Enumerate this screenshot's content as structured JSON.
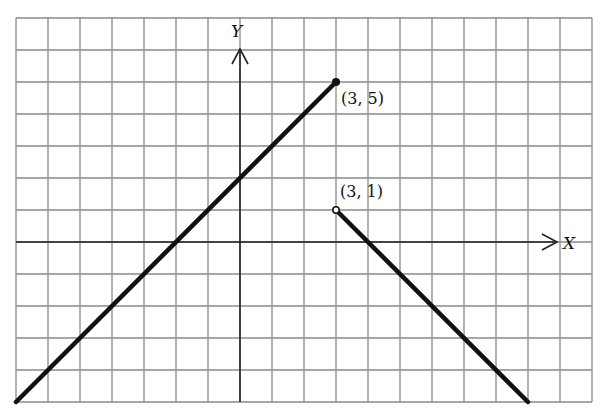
{
  "chart_data": {
    "type": "line",
    "title": "",
    "xlabel": "X",
    "ylabel": "Y",
    "xlim": [
      -7,
      11
    ],
    "ylim": [
      -5,
      7
    ],
    "grid": true,
    "grid_step": 1,
    "series": [
      {
        "name": "left-piece",
        "equation": "y = x + 2",
        "x": [
          -7,
          3
        ],
        "y": [
          -5,
          5
        ],
        "end_marker": {
          "x": 3,
          "y": 5,
          "style": "filled",
          "label": "(3, 5)"
        }
      },
      {
        "name": "right-piece",
        "equation": "y = -x + 4",
        "x": [
          3,
          9
        ],
        "y": [
          1,
          -5
        ],
        "start_marker": {
          "x": 3,
          "y": 1,
          "style": "open",
          "label": "(3, 1)"
        }
      }
    ],
    "annotations": [
      {
        "text": "(3, 5)",
        "x": 3,
        "y": 5
      },
      {
        "text": "(3, 1)",
        "x": 3,
        "y": 1
      }
    ]
  },
  "layout": {
    "origin_px": [
      240,
      242
    ],
    "cell_px": 32,
    "colors": {
      "grid": "#8a8a8a",
      "axis": "#222222",
      "line": "#111111",
      "background": "#ffffff"
    }
  },
  "labels": {
    "x_axis": "X",
    "y_axis": "Y",
    "point_filled": "(3, 5)",
    "point_open": "(3, 1)"
  }
}
